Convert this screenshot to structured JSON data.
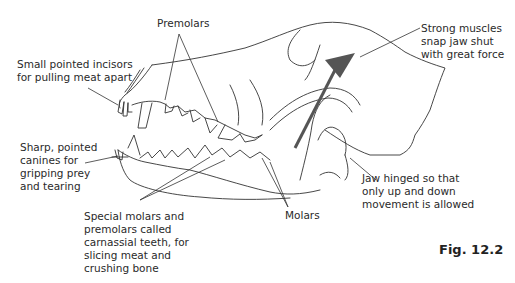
{
  "figure": {
    "caption": "Fig. 12.2"
  },
  "labels": {
    "premolars": "Premolars",
    "incisors": "Small pointed incisors\nfor pulling meat apart",
    "canines": "Sharp, pointed\ncanines for\ngripping prey\nand tearing",
    "carnassial": "Special molars and\npremolars called\ncarnassial teeth, for\nslicing meat and\ncrushing bone",
    "molars": "Molars",
    "muscles": "Strong muscles\nsnap jaw shut\nwith great force",
    "jaw_hinge": "Jaw hinged so that\nonly up and down\nmovement is allowed"
  },
  "colors": {
    "line": "#333333",
    "arrow": "#555555",
    "text": "#2a2a2a"
  }
}
